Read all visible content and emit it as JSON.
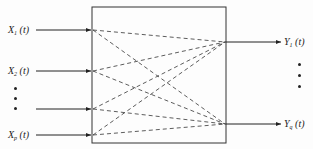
{
  "diagram": {
    "type": "multi-input multi-output system block diagram",
    "inputs": [
      {
        "id": "x1",
        "base": "X",
        "sub": "1",
        "arg": "(t)",
        "y": 30
      },
      {
        "id": "x2",
        "base": "X",
        "sub": "2",
        "arg": "(t)",
        "y": 71
      },
      {
        "id": "x_blank",
        "base": "",
        "sub": "",
        "arg": "",
        "y": 109
      },
      {
        "id": "xp",
        "base": "X",
        "sub": "p",
        "arg": "(t)",
        "y": 135
      }
    ],
    "outputs": [
      {
        "id": "y1",
        "base": "Y",
        "sub": "1",
        "arg": "(t)",
        "y": 42
      },
      {
        "id": "yq",
        "base": "Y",
        "sub": "q",
        "arg": "(t)",
        "y": 124
      }
    ],
    "input_ellipsis": "⋮",
    "output_ellipsis": "⋮",
    "connections": "each input connected to each output by dashed line",
    "colors": {
      "line": "#222222",
      "background": "#fdfdfd"
    }
  }
}
